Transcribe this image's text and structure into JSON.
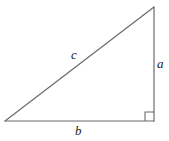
{
  "figure": {
    "kind": "right-triangle-diagram",
    "background_color": "#ffffff",
    "stroke_color": "#6b6b6b",
    "label_color": "#1a1a1a",
    "stroke_width": 1.2,
    "width": 169,
    "height": 141
  },
  "geometry": {
    "vertices": {
      "apex": {
        "x": 154,
        "y": 7
      },
      "bottom_right": {
        "x": 154,
        "y": 121
      },
      "bottom_left": {
        "x": 5,
        "y": 121
      }
    },
    "right_angle_marker": {
      "at_vertex": "bottom_right",
      "size": 9,
      "x": 145,
      "y": 112
    }
  },
  "labels": {
    "hypotenuse": "c",
    "vertical_leg": "a",
    "horizontal_leg": "b"
  }
}
